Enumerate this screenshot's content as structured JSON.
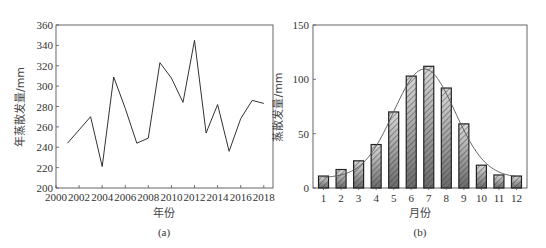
{
  "chart_data": [
    {
      "id": "a",
      "type": "line",
      "title": "",
      "caption": "(a)",
      "xlabel": "年份",
      "ylabel": "年蒸散发量/mm",
      "x": [
        2001,
        2002,
        2003,
        2004,
        2005,
        2006,
        2007,
        2008,
        2009,
        2010,
        2011,
        2012,
        2013,
        2014,
        2015,
        2016,
        2017,
        2018
      ],
      "values": [
        244,
        257,
        270,
        221,
        309,
        278,
        244,
        249,
        323,
        308,
        284,
        345,
        254,
        282,
        236,
        268,
        286,
        283
      ],
      "xlim": [
        2000,
        2018.8
      ],
      "ylim": [
        200,
        360
      ],
      "xticks": [
        "2000",
        "2002",
        "2004",
        "2006",
        "2008",
        "2010",
        "2012",
        "2014",
        "2016",
        "2018"
      ],
      "yticks": [
        "200",
        "220",
        "240",
        "260",
        "280",
        "300",
        "320",
        "340",
        "360"
      ],
      "grid": false,
      "legend": null
    },
    {
      "id": "b",
      "type": "bar",
      "title": "",
      "caption": "(b)",
      "xlabel": "月份",
      "ylabel": "蒸散发量/mm",
      "categories": [
        "1",
        "2",
        "3",
        "4",
        "5",
        "6",
        "7",
        "8",
        "9",
        "10",
        "11",
        "12"
      ],
      "values": [
        11,
        17,
        25,
        40,
        70,
        103,
        112,
        92,
        59,
        21,
        12,
        11
      ],
      "overlay": "smooth fitted curve (normal-like) through bar tops",
      "ylim": [
        0,
        150
      ],
      "yticks": [
        "0",
        "50",
        "100",
        "150"
      ],
      "grid": false,
      "legend": null,
      "bar_style": "hatched diagonal, gray gradient, black outline"
    }
  ],
  "colors": {
    "axis": "#555555",
    "line": "#333333",
    "bar_outline": "#222222",
    "bar_fill_light": "#d9d9d9",
    "bar_fill_dark": "#707070",
    "curve": "#555555"
  }
}
